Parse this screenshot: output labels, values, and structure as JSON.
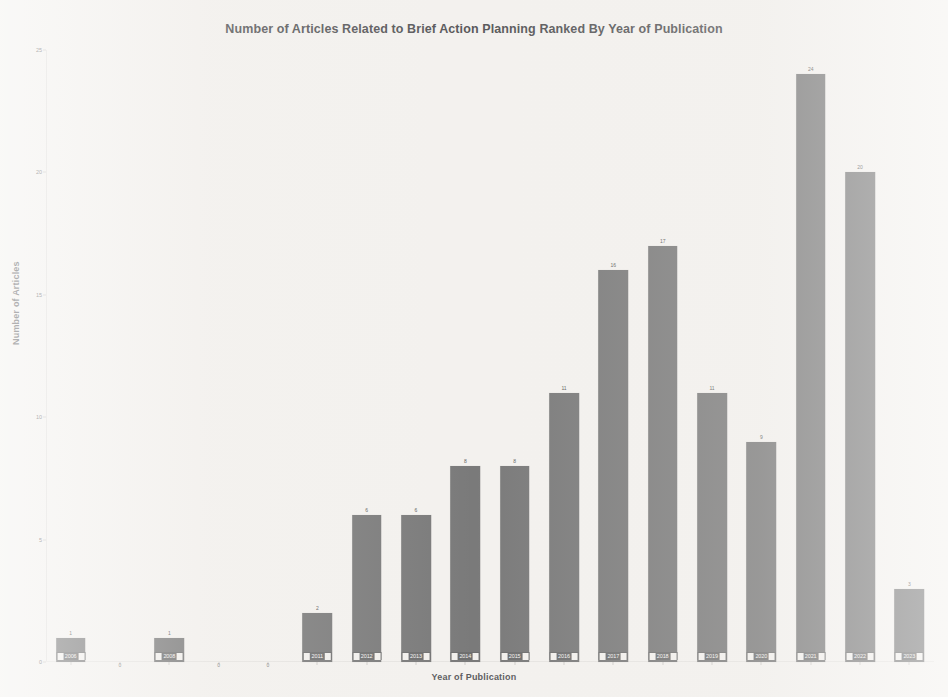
{
  "chart_data": {
    "type": "bar",
    "title": "Number of Articles Related to Brief Action Planning Ranked By Year of Publication",
    "xlabel": "Year of Publication",
    "ylabel": "Number of Articles",
    "categories": [
      "2006",
      "2007",
      "2008",
      "2009",
      "2010",
      "2011",
      "2012",
      "2013",
      "2014",
      "2015",
      "2016",
      "2017",
      "2018",
      "2019",
      "2020",
      "2021",
      "2022",
      "2023"
    ],
    "values": [
      1,
      0,
      1,
      0,
      0,
      2,
      6,
      6,
      8,
      8,
      11,
      16,
      17,
      11,
      9,
      24,
      20,
      3
    ],
    "ylim": [
      0,
      25
    ],
    "yticks": [
      0,
      5,
      10,
      15,
      20,
      25
    ],
    "ytick_labels": [
      "0",
      "5",
      "10",
      "15",
      "20",
      "25"
    ],
    "grid": false,
    "legend": false,
    "bar_color": "#7a7a7a",
    "background_color": "#f3f1ee",
    "text_color": "#59595b"
  },
  "background_artifacts": {
    "ghost_line_1": "scanned text bleed-through",
    "ghost_line_2": "scanned text bleed-through",
    "ghost_line_3": "scanned text bleed-through",
    "ghost_line_4": "scanned text bleed-through"
  }
}
